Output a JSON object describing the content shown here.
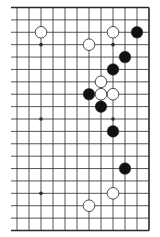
{
  "diagram": {
    "type": "go-board-fragment",
    "columns": 12,
    "rows": 19,
    "edges": {
      "top": true,
      "right": true,
      "bottom": true,
      "left": false
    },
    "colors": {
      "line": "#2a2a2a",
      "black_stone": "#111111",
      "white_stone": "#ffffff",
      "stone_outline": "#222222",
      "background": "#ffffff"
    },
    "star_points": [
      {
        "col": 2,
        "row": 3
      },
      {
        "col": 8,
        "row": 3
      },
      {
        "col": 2,
        "row": 9
      },
      {
        "col": 8,
        "row": 9
      },
      {
        "col": 2,
        "row": 15
      },
      {
        "col": 8,
        "row": 15
      }
    ],
    "stones": [
      {
        "color": "white",
        "col": 2,
        "row": 2
      },
      {
        "color": "white",
        "col": 8,
        "row": 2
      },
      {
        "color": "black",
        "col": 10,
        "row": 2
      },
      {
        "color": "white",
        "col": 6,
        "row": 3
      },
      {
        "color": "black",
        "col": 9,
        "row": 4
      },
      {
        "color": "black",
        "col": 8,
        "row": 5
      },
      {
        "color": "white",
        "col": 7,
        "row": 6
      },
      {
        "color": "black",
        "col": 6,
        "row": 7
      },
      {
        "color": "white",
        "col": 7,
        "row": 7
      },
      {
        "color": "white",
        "col": 8,
        "row": 7
      },
      {
        "color": "black",
        "col": 7,
        "row": 8
      },
      {
        "color": "black",
        "col": 8,
        "row": 10
      },
      {
        "color": "black",
        "col": 9,
        "row": 13
      },
      {
        "color": "white",
        "col": 8,
        "row": 15
      },
      {
        "color": "white",
        "col": 6,
        "row": 16
      }
    ]
  }
}
